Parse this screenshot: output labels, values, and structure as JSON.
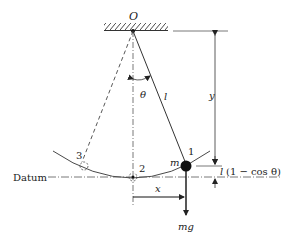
{
  "diagram": {
    "labels": {
      "pivot": "O",
      "angle": "θ",
      "length": "l",
      "height": "y",
      "mass": "m",
      "position_1": "1",
      "position_2": "2",
      "position_3": "3",
      "datum": "Datum",
      "horizontal": "x",
      "weight": "mg",
      "drop_l": "l",
      "drop_expr": "(1 − cos θ)"
    },
    "colors": {
      "line": "#333333",
      "bob": "#111111",
      "background": "#ffffff"
    }
  }
}
